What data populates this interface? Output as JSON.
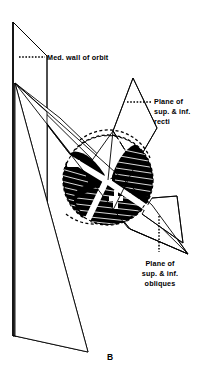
{
  "figure": {
    "panel_letter": "B",
    "background_color": "#ffffff",
    "ink_color": "#000000"
  },
  "labels": [
    {
      "id": "med-wall-of-orbit",
      "lines": [
        "Med. wall of orbit"
      ],
      "text": "Med. wall of orbit",
      "anchor": "start",
      "x": 47,
      "y": 59,
      "leader": "dotted-horizontal"
    },
    {
      "id": "plane-of-sup-inf-recti",
      "lines": [
        "Plane of",
        "sup. & inf.",
        "recti"
      ],
      "text": "Plane of sup. & inf. recti",
      "anchor": "start",
      "x": 154,
      "y": 104,
      "leader": "dotted-horizontal"
    },
    {
      "id": "plane-of-sup-inf-obliques",
      "lines": [
        "Plane of",
        "sup. & inf.",
        "obliques"
      ],
      "text": "Plane of sup. & inf. obliques",
      "anchor": "middle",
      "x": 160,
      "y": 272,
      "leader": "dotted-vertical"
    }
  ],
  "label_line_text": {
    "med_wall_0": "Med. wall of orbit",
    "recti_0": "Plane of",
    "recti_1": "sup. & inf.",
    "recti_2": "recti",
    "obliques_0": "Plane of",
    "obliques_1": "sup. & inf.",
    "obliques_2": "obliques"
  },
  "structures": [
    {
      "id": "medial-wall-plane",
      "name": "Medial wall of orbit",
      "type": "quadrilateral-plane",
      "orientation": "vertical-left"
    },
    {
      "id": "recti-plane",
      "name": "Plane of superior & inferior recti",
      "type": "quadrilateral-plane",
      "orientation": "oblique-upper-right"
    },
    {
      "id": "obliques-plane",
      "name": "Plane of superior & inferior obliques",
      "type": "quadrilateral-plane",
      "orientation": "oblique-lower-right"
    },
    {
      "id": "eyeball",
      "name": "Eyeball (globe)",
      "type": "sphere-sectioned",
      "shading": "dark-hatched-quadrants"
    }
  ]
}
